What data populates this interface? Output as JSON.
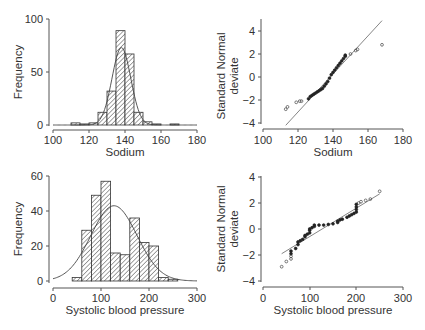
{
  "figure": {
    "panels": {
      "sodium_hist": {
        "ylabel": "Frequency",
        "xlabel": "Sodium",
        "xticks": [
          "100",
          "120",
          "140",
          "160",
          "180"
        ],
        "yticks": [
          "0",
          "50",
          "100"
        ]
      },
      "sodium_qq": {
        "ylabel_line1": "Standard Normal",
        "ylabel_line2": "deviate",
        "xlabel": "Sodium",
        "xticks": [
          "100",
          "120",
          "140",
          "160",
          "180"
        ],
        "yticks": [
          "4",
          "2",
          "0",
          "−2",
          "−4"
        ]
      },
      "sbp_hist": {
        "ylabel": "Frequency",
        "xlabel": "Systolic blood pressure",
        "xticks": [
          "0",
          "100",
          "200",
          "300"
        ],
        "yticks": [
          "0",
          "20",
          "40",
          "60"
        ]
      },
      "sbp_qq": {
        "ylabel_line1": "Standard Normal",
        "ylabel_line2": "deviate",
        "xlabel": "Systolic blood pressure",
        "xticks": [
          "0",
          "100",
          "200",
          "300"
        ],
        "yticks": [
          "4",
          "2",
          "0",
          "−2",
          "−4"
        ]
      }
    }
  },
  "chart_data": [
    {
      "type": "bar",
      "title": "",
      "xlabel": "Sodium",
      "ylabel": "Frequency",
      "xlim": [
        100,
        180
      ],
      "ylim": [
        0,
        100
      ],
      "bin_width": 5,
      "bin_starts": [
        110,
        115,
        120,
        125,
        130,
        135,
        140,
        145,
        150,
        155,
        165
      ],
      "values": [
        2,
        1,
        2,
        12,
        32,
        89,
        67,
        12,
        3,
        1,
        1
      ],
      "overlay": {
        "type": "normal_curve",
        "mean": 138,
        "sd": 5.2,
        "peak": 73
      },
      "grid": false,
      "hatch": "diagonal"
    },
    {
      "type": "scatter",
      "title": "Normal plot",
      "xlabel": "Sodium",
      "ylabel": "Standard Normal deviate",
      "xlim": [
        100,
        180
      ],
      "ylim": [
        -4,
        4
      ],
      "reference_line": [
        [
          113,
          -4.2
        ],
        [
          168,
          4.9
        ]
      ],
      "points": [
        [
          113,
          -2.8
        ],
        [
          114,
          -2.6
        ],
        [
          119,
          -2.2
        ],
        [
          121,
          -2.1
        ],
        [
          122,
          -2.1
        ],
        [
          126,
          -1.9
        ],
        [
          127,
          -1.7
        ],
        [
          128,
          -1.6
        ],
        [
          129,
          -1.5
        ],
        [
          130,
          -1.4
        ],
        [
          131,
          -1.3
        ],
        [
          132,
          -1.2
        ],
        [
          133,
          -1.1
        ],
        [
          134,
          -1.0
        ],
        [
          135,
          -0.8
        ],
        [
          136,
          -0.6
        ],
        [
          137,
          -0.4
        ],
        [
          138,
          -0.1
        ],
        [
          139,
          0.2
        ],
        [
          140,
          0.4
        ],
        [
          141,
          0.6
        ],
        [
          142,
          0.8
        ],
        [
          143,
          1.0
        ],
        [
          144,
          1.2
        ],
        [
          145,
          1.4
        ],
        [
          146,
          1.6
        ],
        [
          147,
          1.8
        ],
        [
          147,
          1.9
        ],
        [
          150,
          2.0
        ],
        [
          153,
          2.3
        ],
        [
          154,
          2.4
        ],
        [
          168,
          2.8
        ]
      ],
      "grid": false
    },
    {
      "type": "bar",
      "title": "",
      "xlabel": "Systolic blood pressure",
      "ylabel": "Frequency",
      "xlim": [
        0,
        300
      ],
      "ylim": [
        0,
        60
      ],
      "bin_width": 20,
      "bin_starts": [
        40,
        60,
        80,
        100,
        120,
        140,
        160,
        180,
        200,
        220,
        240
      ],
      "values": [
        2,
        29,
        49,
        57,
        16,
        15,
        36,
        22,
        20,
        2,
        1
      ],
      "overlay": {
        "type": "normal_curve",
        "mean": 127,
        "sd": 48,
        "peak": 43
      },
      "grid": false,
      "hatch": "diagonal"
    },
    {
      "type": "scatter",
      "title": "Normal plot",
      "xlabel": "Systolic blood pressure",
      "ylabel": "Standard Normal deviate",
      "xlim": [
        0,
        300
      ],
      "ylim": [
        -4,
        4
      ],
      "reference_line": [
        [
          40,
          -1.9
        ],
        [
          250,
          2.7
        ]
      ],
      "points": [
        [
          40,
          -2.9
        ],
        [
          50,
          -2.5
        ],
        [
          60,
          -2.3
        ],
        [
          60,
          -2.1
        ],
        [
          60,
          -1.9
        ],
        [
          60,
          -1.7
        ],
        [
          70,
          -1.5
        ],
        [
          75,
          -1.2
        ],
        [
          75,
          -1.0
        ],
        [
          80,
          -0.9
        ],
        [
          85,
          -0.8
        ],
        [
          90,
          -0.6
        ],
        [
          90,
          -0.5
        ],
        [
          95,
          -0.4
        ],
        [
          100,
          -0.3
        ],
        [
          100,
          -0.1
        ],
        [
          100,
          0.0
        ],
        [
          105,
          0.1
        ],
        [
          110,
          0.2
        ],
        [
          110,
          0.3
        ],
        [
          120,
          0.3
        ],
        [
          130,
          0.3
        ],
        [
          140,
          0.35
        ],
        [
          150,
          0.4
        ],
        [
          160,
          0.5
        ],
        [
          160,
          0.6
        ],
        [
          165,
          0.7
        ],
        [
          170,
          0.75
        ],
        [
          180,
          0.9
        ],
        [
          185,
          1.0
        ],
        [
          190,
          1.1
        ],
        [
          195,
          1.2
        ],
        [
          200,
          1.3
        ],
        [
          200,
          1.5
        ],
        [
          200,
          1.7
        ],
        [
          200,
          1.9
        ],
        [
          205,
          2.0
        ],
        [
          210,
          2.1
        ],
        [
          220,
          2.2
        ],
        [
          230,
          2.3
        ],
        [
          250,
          2.9
        ]
      ],
      "grid": false
    }
  ]
}
